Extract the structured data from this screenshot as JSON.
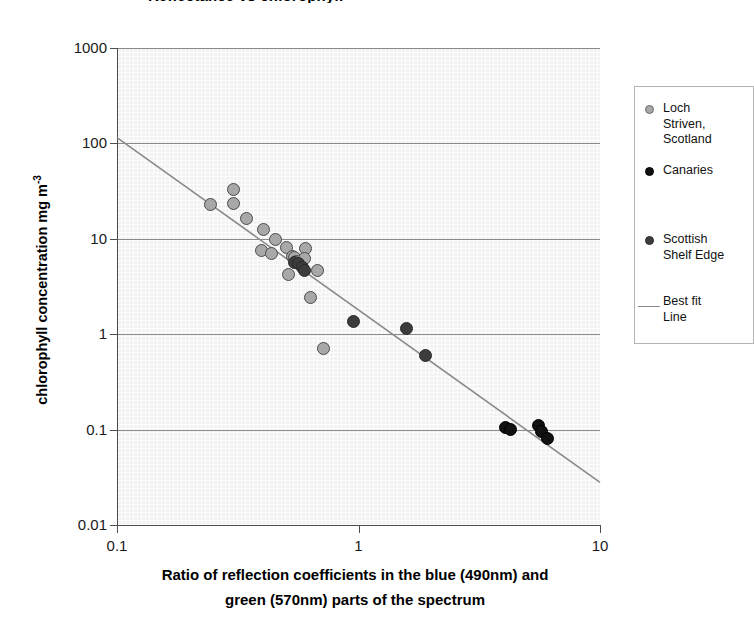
{
  "title_fragment": "Reflectance vs chlorophyll",
  "axes": {
    "ylabel_main": "chlorophyll concentration mg m",
    "ylabel_exponent": "-3",
    "xlabel_line1": "Ratio of reflection coefficients in the blue (490nm) and",
    "xlabel_line2": "green (570nm) parts of the spectrum",
    "yticks": [
      "1000",
      "100",
      "10",
      "1",
      "0.1",
      "0.01"
    ],
    "xticks": [
      "0.1",
      "1",
      "10"
    ]
  },
  "legend": {
    "items": [
      {
        "label": "Loch\nStriven,\nScotland",
        "marker": "circle-light-gray",
        "color": "#a8a8a8"
      },
      {
        "label": "Canaries",
        "marker": "circle-black",
        "color": "#111111"
      },
      {
        "label": "Scottish\nShelf Edge",
        "marker": "circle-dark-gray",
        "color": "#3c3c3c"
      },
      {
        "label": "Best fit\nLine",
        "marker": "line",
        "color": "#8a8a8a"
      }
    ]
  },
  "chart_data": {
    "type": "scatter",
    "title": "",
    "xlabel": "Ratio of reflection coefficients in the blue (490nm) and green (570nm) parts of the spectrum",
    "ylabel": "chlorophyll concentration mg m-3",
    "xscale": "log",
    "yscale": "log",
    "xlim": [
      0.1,
      10
    ],
    "ylim": [
      0.01,
      1000
    ],
    "grid": "horizontal-decades",
    "legend_position": "right-outside",
    "series": [
      {
        "name": "Loch Striven, Scotland",
        "color": "#a8a8a8",
        "marker": "circle",
        "points": [
          [
            0.245,
            23.0
          ],
          [
            0.305,
            33.0
          ],
          [
            0.305,
            23.5
          ],
          [
            0.345,
            16.5
          ],
          [
            0.405,
            12.5
          ],
          [
            0.395,
            7.6
          ],
          [
            0.435,
            7.0
          ],
          [
            0.455,
            9.8
          ],
          [
            0.505,
            8.2
          ],
          [
            0.535,
            6.6
          ],
          [
            0.545,
            6.3
          ],
          [
            0.555,
            5.8
          ],
          [
            0.515,
            4.2
          ],
          [
            0.605,
            7.9
          ],
          [
            0.595,
            6.2
          ],
          [
            0.675,
            4.7
          ],
          [
            0.635,
            2.4
          ],
          [
            0.715,
            0.7
          ]
        ]
      },
      {
        "name": "Scottish Shelf Edge",
        "color": "#3c3c3c",
        "marker": "circle",
        "points": [
          [
            0.545,
            5.6
          ],
          [
            0.565,
            5.5
          ],
          [
            0.585,
            5.0
          ],
          [
            0.595,
            4.6
          ],
          [
            0.955,
            1.35
          ],
          [
            1.58,
            1.15
          ],
          [
            1.9,
            0.6
          ]
        ]
      },
      {
        "name": "Canaries",
        "color": "#111111",
        "marker": "circle",
        "points": [
          [
            4.05,
            0.105
          ],
          [
            4.25,
            0.1
          ],
          [
            5.55,
            0.11
          ],
          [
            5.75,
            0.095
          ],
          [
            6.05,
            0.08
          ]
        ]
      }
    ],
    "fit_line": {
      "name": "Best fit Line",
      "color": "#8a8a8a",
      "x": [
        0.1,
        10
      ],
      "y": [
        115,
        0.028
      ]
    }
  }
}
